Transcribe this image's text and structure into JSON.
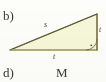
{
  "figure": {
    "background_color": "#fdfdfb",
    "part_labels": [
      {
        "name": "part-label-b",
        "text": "b)"
      },
      {
        "name": "part-label-d",
        "text": "d)"
      }
    ],
    "stray_text": {
      "text": "M"
    },
    "triangle": {
      "kind": "right-triangle",
      "fill_color": "#f6f6d9",
      "stroke_color": "#8c8a4e",
      "stroke_width": 1.1,
      "vertices": {
        "left": {
          "x": 10,
          "y": 50
        },
        "top_right": {
          "x": 97,
          "y": 14
        },
        "bottom_right": {
          "x": 97,
          "y": 50
        }
      },
      "right_angle_marker": {
        "name": "right-angle-arc",
        "at_vertex": "bottom_right",
        "type": "arc-with-dot",
        "radius": 11
      },
      "side_labels": [
        {
          "name": "hypotenuse-label",
          "text": "s",
          "side": "hypotenuse"
        },
        {
          "name": "base-label",
          "text": "t",
          "side": "base"
        },
        {
          "name": "vertical-leg-label",
          "text": "t",
          "side": "vertical-leg"
        }
      ]
    }
  }
}
